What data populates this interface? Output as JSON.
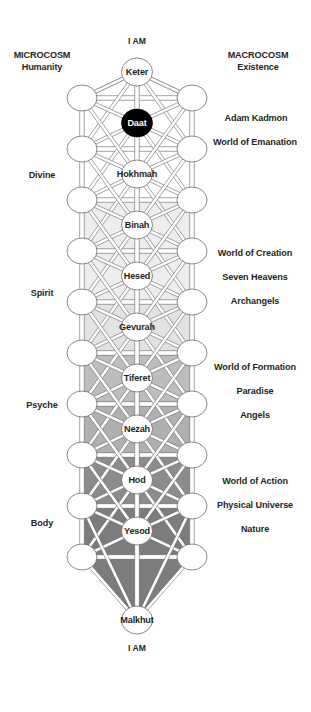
{
  "diagram": {
    "apex_top_label": "I AM",
    "apex_bottom_label": "I AM",
    "geometry": {
      "center_x": 137,
      "left_x": 82,
      "right_x": 192,
      "node_rx": 15.5,
      "node_ry": 14.0,
      "side_rx": 15.0,
      "side_ry": 13.0
    },
    "central_nodes": [
      {
        "id": "keter",
        "label": "Keter",
        "x": 137,
        "y": 72,
        "style": "white"
      },
      {
        "id": "daat",
        "label": "Daat",
        "x": 137,
        "y": 123,
        "style": "black"
      },
      {
        "id": "hokhmah",
        "label": "Hokhmah",
        "x": 137,
        "y": 174,
        "style": "white"
      },
      {
        "id": "binah",
        "label": "Binah",
        "x": 137,
        "y": 225,
        "style": "white"
      },
      {
        "id": "hesed",
        "label": "Hesed",
        "x": 137,
        "y": 276,
        "style": "white"
      },
      {
        "id": "gevurah",
        "label": "Gevurah",
        "x": 137,
        "y": 327,
        "style": "white"
      },
      {
        "id": "tiferet",
        "label": "Tiferet",
        "x": 137,
        "y": 378,
        "style": "white"
      },
      {
        "id": "nezah",
        "label": "Nezah",
        "x": 137,
        "y": 429,
        "style": "white"
      },
      {
        "id": "hod",
        "label": "Hod",
        "x": 137,
        "y": 480,
        "style": "white"
      },
      {
        "id": "yesod",
        "label": "Yesod",
        "x": 137,
        "y": 531,
        "style": "white"
      },
      {
        "id": "malkhut",
        "label": "Malkhut",
        "x": 137,
        "y": 620,
        "style": "white"
      }
    ],
    "side_node_rows": [
      98,
      149,
      200,
      251,
      302,
      353,
      404,
      455,
      506,
      557
    ],
    "shading_bands": [
      {
        "from": 200,
        "to": 302,
        "color": "#ededed"
      },
      {
        "from": 302,
        "to": 353,
        "color": "#e2e2e2"
      },
      {
        "from": 353,
        "to": 404,
        "color": "#bdbdbd"
      },
      {
        "from": 404,
        "to": 455,
        "color": "#b0b0b0"
      },
      {
        "from": 455,
        "to": 506,
        "color": "#8c8c8c"
      },
      {
        "from": 506,
        "to": 557,
        "color": "#7c7c7c"
      },
      {
        "from": 557,
        "to": 620,
        "color": "#7c7c7c"
      }
    ],
    "labels_left": [
      {
        "id": "microcosm",
        "lines": [
          "MICROCOSM",
          "Humanity"
        ],
        "x": 8,
        "y": 50,
        "w": 68
      },
      {
        "id": "divine",
        "lines": [
          "Divine"
        ],
        "x": 8,
        "y": 170,
        "w": 68
      },
      {
        "id": "spirit",
        "lines": [
          "Spirit"
        ],
        "x": 8,
        "y": 288,
        "w": 68
      },
      {
        "id": "psyche",
        "lines": [
          "Psyche"
        ],
        "x": 8,
        "y": 400,
        "w": 68
      },
      {
        "id": "body",
        "lines": [
          "Body"
        ],
        "x": 8,
        "y": 518,
        "w": 68
      }
    ],
    "labels_right": [
      {
        "id": "macrocosm",
        "lines": [
          "MACROCOSM",
          "Existence"
        ],
        "x": 212,
        "y": 50,
        "w": 92
      },
      {
        "id": "adam-kadmon",
        "lines": [
          "Adam Kadmon"
        ],
        "x": 206,
        "y": 113,
        "w": 100
      },
      {
        "id": "world-of-emanation",
        "lines": [
          "World of Emanation"
        ],
        "x": 201,
        "y": 137,
        "w": 108
      },
      {
        "id": "world-of-creation",
        "lines": [
          "World of Creation"
        ],
        "x": 201,
        "y": 248,
        "w": 108
      },
      {
        "id": "seven-heavens",
        "lines": [
          "Seven Heavens"
        ],
        "x": 201,
        "y": 272,
        "w": 108
      },
      {
        "id": "archangels",
        "lines": [
          "Archangels"
        ],
        "x": 201,
        "y": 296,
        "w": 108
      },
      {
        "id": "world-of-formation",
        "lines": [
          "World of Formation"
        ],
        "x": 201,
        "y": 362,
        "w": 108
      },
      {
        "id": "paradise",
        "lines": [
          "Paradise"
        ],
        "x": 201,
        "y": 386,
        "w": 108
      },
      {
        "id": "angels",
        "lines": [
          "Angels"
        ],
        "x": 201,
        "y": 410,
        "w": 108
      },
      {
        "id": "world-of-action",
        "lines": [
          "World of Action"
        ],
        "x": 201,
        "y": 476,
        "w": 108
      },
      {
        "id": "physical-universe",
        "lines": [
          "Physical Universe"
        ],
        "x": 201,
        "y": 500,
        "w": 108
      },
      {
        "id": "nature",
        "lines": [
          "Nature"
        ],
        "x": 201,
        "y": 524,
        "w": 108
      }
    ],
    "colors": {
      "stroke": "#58585b",
      "text": "#231f20",
      "node_fill": "#ffffff",
      "daat_fill": "#000000",
      "daat_text": "#ffffff"
    }
  }
}
